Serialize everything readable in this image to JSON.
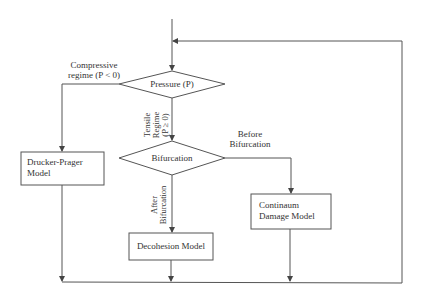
{
  "diagram": {
    "type": "flowchart",
    "nodes": {
      "pressure": {
        "label": "Pressure (P)",
        "shape": "diamond"
      },
      "bifurcation": {
        "label": "Bifurcation",
        "shape": "diamond"
      },
      "drucker_prager": {
        "line1": "Drucker-Prager",
        "line2": "Model",
        "shape": "rectangle"
      },
      "decohesion": {
        "label": "Decohesion Model",
        "shape": "rectangle"
      },
      "continuum": {
        "line1": "Continaum",
        "line2": "Damage Model",
        "shape": "rectangle"
      }
    },
    "edge_labels": {
      "compressive": {
        "line1": "Compressive",
        "line2": "regime (P < 0)"
      },
      "tensile": {
        "line1": "Tensile",
        "line2": "Regime",
        "line3": "(P ≥ 0)"
      },
      "before": {
        "line1": "Before",
        "line2": "Bifurcation"
      },
      "after": {
        "line1": "After",
        "line2": "Bifurcation"
      }
    },
    "edges": [
      {
        "from": "start",
        "to": "pressure"
      },
      {
        "from": "pressure",
        "to": "drucker_prager",
        "label": "Compressive regime (P < 0)"
      },
      {
        "from": "pressure",
        "to": "bifurcation",
        "label": "Tensile Regime (P ≥ 0)"
      },
      {
        "from": "bifurcation",
        "to": "continuum",
        "label": "Before Bifurcation"
      },
      {
        "from": "bifurcation",
        "to": "decohesion",
        "label": "After Bifurcation"
      },
      {
        "from": "drucker_prager",
        "to": "merge"
      },
      {
        "from": "decohesion",
        "to": "merge"
      },
      {
        "from": "continuum",
        "to": "merge"
      },
      {
        "from": "merge",
        "to": "pressure",
        "label": "feedback loop"
      }
    ],
    "colors": {
      "line": "#444444",
      "text": "#333333",
      "background": "#ffffff"
    }
  }
}
